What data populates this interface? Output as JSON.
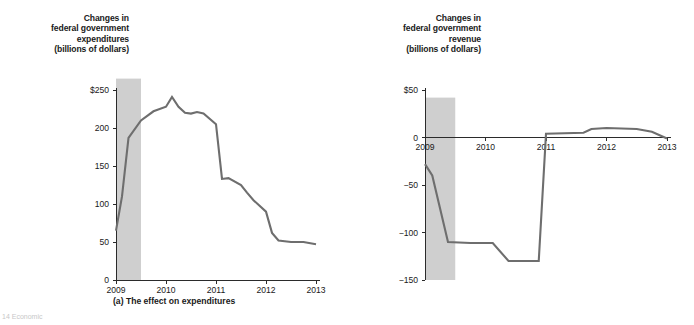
{
  "figure": {
    "background": "#ffffff",
    "line_color": "#6e6e6e",
    "band_color": "#cfcfcf",
    "axis_color": "#2b2b2b",
    "footer_fragment": "14 Economic"
  },
  "panels": [
    {
      "id": "a",
      "caption": "(a) The effect on expenditures",
      "axis_title_lines": [
        "Changes in",
        "federal government",
        "expenditures",
        "(billions of dollars)"
      ]
    },
    {
      "id": "b",
      "caption": "(b) The effect on revenue",
      "axis_title_lines": [
        "Changes in",
        "federal government",
        "revenue",
        "(billions of dollars)"
      ]
    }
  ],
  "chart_data": [
    {
      "type": "line",
      "title": "Changes in federal government expenditures (billions of dollars)",
      "panel_label": "(a) The effect on expenditures",
      "xlabel": "",
      "ylabel": "Changes in federal government expenditures (billions of dollars)",
      "xlim": [
        2009.0,
        2013.0
      ],
      "ylim": [
        0,
        250
      ],
      "xticks": [
        2009,
        2010,
        2011,
        2012,
        2013
      ],
      "xticklabels": [
        "2009",
        "2010",
        "2011",
        "2012",
        "2013"
      ],
      "yticks": [
        0,
        50,
        100,
        150,
        200,
        250
      ],
      "yticklabels": [
        "0",
        "50",
        "100",
        "150",
        "200",
        "$250"
      ],
      "grid": false,
      "legend": "none",
      "shaded_region": {
        "label": "recession",
        "x_start": 2009.0,
        "x_end": 2009.5,
        "y_start": 0,
        "y_end": 265
      },
      "x": [
        2009.0,
        2009.12,
        2009.25,
        2009.5,
        2009.75,
        2010.0,
        2010.12,
        2010.25,
        2010.38,
        2010.5,
        2010.62,
        2010.75,
        2011.0,
        2011.12,
        2011.25,
        2011.5,
        2011.62,
        2011.75,
        2012.0,
        2012.12,
        2012.25,
        2012.5,
        2012.75,
        2013.0
      ],
      "y": [
        65,
        110,
        187,
        210,
        222,
        228,
        241,
        228,
        220,
        219,
        221,
        219,
        205,
        133,
        134,
        125,
        115,
        105,
        90,
        62,
        52,
        50,
        50,
        47
      ],
      "values_note": "billions of dollars"
    },
    {
      "type": "line",
      "title": "Changes in federal government revenue (billions of dollars)",
      "panel_label": "(b) The effect on revenue",
      "xlabel": "",
      "ylabel": "Changes in federal government revenue (billions of dollars)",
      "xlim": [
        2009.0,
        2013.0
      ],
      "ylim": [
        -150,
        50
      ],
      "xticks": [
        2009,
        2010,
        2011,
        2012,
        2013
      ],
      "xticklabels": [
        "2009",
        "2010",
        "2011",
        "2012",
        "2013"
      ],
      "yticks": [
        -150,
        -100,
        -50,
        0,
        50
      ],
      "yticklabels": [
        "-150",
        "-100",
        "-50",
        "0",
        "$50"
      ],
      "grid": false,
      "legend": "none",
      "shaded_region": {
        "label": "recession",
        "x_start": 2009.0,
        "x_end": 2009.5,
        "y_start": -150,
        "y_end": 42
      },
      "x": [
        2009.0,
        2009.12,
        2009.38,
        2009.75,
        2010.12,
        2010.38,
        2010.75,
        2010.88,
        2011.0,
        2011.62,
        2011.75,
        2012.0,
        2012.5,
        2012.75,
        2013.0
      ],
      "y": [
        -28,
        -40,
        -110,
        -111,
        -111,
        -130,
        -130,
        -130,
        4,
        5,
        9,
        10,
        9,
        6,
        -1
      ],
      "values_note": "billions of dollars"
    }
  ]
}
